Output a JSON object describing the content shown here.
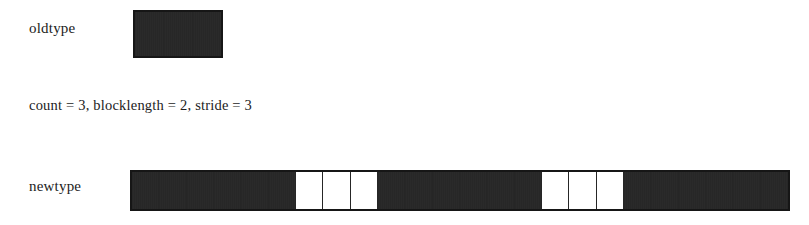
{
  "figure": {
    "background_color": "#ffffff",
    "ink_color": "#1c1c1c"
  },
  "oldtype": {
    "label": "oldtype",
    "cell_count": 3,
    "cells": [
      "filled",
      "filled",
      "filled"
    ]
  },
  "parameters": {
    "text": "count = 3, blocklength = 2, stride = 3",
    "count": 3,
    "blocklength": 2,
    "stride": 3
  },
  "newtype": {
    "label": "newtype",
    "cell_count": 24,
    "cells": [
      "filled",
      "filled",
      "filled",
      "filled",
      "filled",
      "filled",
      "empty",
      "empty",
      "empty",
      "filled",
      "filled",
      "filled",
      "filled",
      "filled",
      "filled",
      "empty",
      "empty",
      "empty",
      "filled",
      "filled",
      "filled",
      "filled",
      "filled",
      "filled"
    ]
  }
}
